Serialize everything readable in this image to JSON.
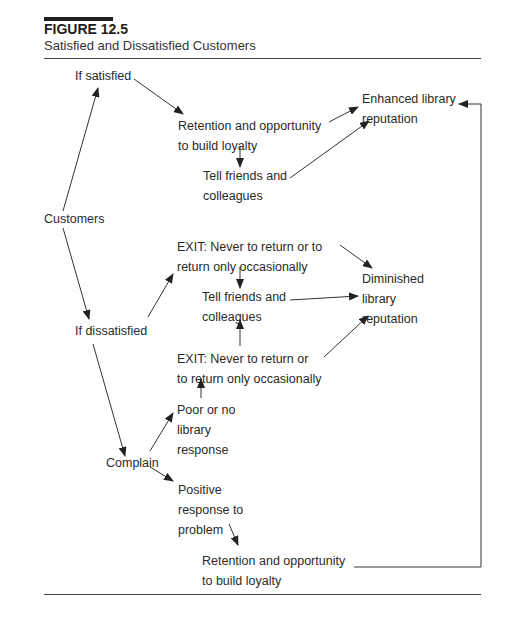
{
  "figure": {
    "number": "FIGURE 12.5",
    "title": "Satisfied and Dissatisfied Customers"
  },
  "nodes": {
    "customers": [
      "Customers"
    ],
    "if_satisfied": [
      "If satisfied"
    ],
    "retention_top": [
      "Retention and opportunity",
      "to build loyalty"
    ],
    "tell_friends_top": [
      "Tell friends and",
      "colleagues"
    ],
    "enhanced_reputation": [
      "Enhanced library",
      "reputation"
    ],
    "if_dissatisfied": [
      "If dissatisfied"
    ],
    "exit_upper": [
      "EXIT: Never to return or to",
      "return only occasionally"
    ],
    "tell_friends_mid": [
      "Tell friends and",
      "colleagues"
    ],
    "diminished_reputation": [
      "Diminished",
      "library",
      "reputation"
    ],
    "exit_lower": [
      "EXIT: Never to return or",
      "to return only occasionally"
    ],
    "poor_response": [
      "Poor or no",
      "library",
      "response"
    ],
    "complain": [
      "Complain"
    ],
    "positive_response": [
      "Positive",
      "response to",
      "problem"
    ],
    "retention_bottom": [
      "Retention and opportunity",
      "to build loyalty"
    ]
  },
  "edges": [
    {
      "from": "customers",
      "to": "if_satisfied"
    },
    {
      "from": "customers",
      "to": "if_dissatisfied"
    },
    {
      "from": "if_satisfied",
      "to": "retention_top"
    },
    {
      "from": "retention_top",
      "to": "tell_friends_top"
    },
    {
      "from": "retention_top",
      "to": "enhanced_reputation"
    },
    {
      "from": "tell_friends_top",
      "to": "enhanced_reputation"
    },
    {
      "from": "if_dissatisfied",
      "to": "exit_upper"
    },
    {
      "from": "if_dissatisfied",
      "to": "complain"
    },
    {
      "from": "exit_upper",
      "to": "tell_friends_mid"
    },
    {
      "from": "exit_upper",
      "to": "diminished_reputation"
    },
    {
      "from": "tell_friends_mid",
      "to": "diminished_reputation"
    },
    {
      "from": "exit_lower",
      "to": "tell_friends_mid"
    },
    {
      "from": "exit_lower",
      "to": "diminished_reputation"
    },
    {
      "from": "poor_response",
      "to": "exit_lower"
    },
    {
      "from": "complain",
      "to": "poor_response"
    },
    {
      "from": "complain",
      "to": "positive_response"
    },
    {
      "from": "positive_response",
      "to": "retention_bottom"
    },
    {
      "from": "retention_bottom",
      "to": "enhanced_reputation"
    }
  ],
  "colors": {
    "text": "#2a2a2a",
    "line": "#333333"
  }
}
